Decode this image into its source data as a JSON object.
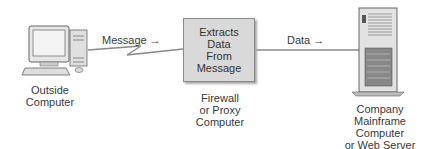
{
  "diagram": {
    "outside_computer": {
      "label": "Outside Computer"
    },
    "message_arrow": {
      "label": "Message",
      "arrow": "→"
    },
    "firewall_box": {
      "text_lines": [
        "Extracts",
        "Data",
        "From",
        "Message"
      ]
    },
    "firewall_label": {
      "lines": [
        "Firewall",
        "or Proxy",
        "Computer"
      ]
    },
    "data_arrow": {
      "label": "Data",
      "arrow": "→"
    },
    "server": {
      "lines": [
        "Company",
        "Mainframe",
        "Computer",
        "or Web Server"
      ]
    }
  }
}
